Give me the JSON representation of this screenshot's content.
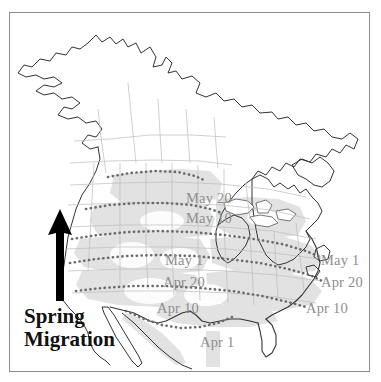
{
  "figure": {
    "type": "map",
    "background_color": "#ffffff",
    "border_color": "#8a8a8a",
    "land_outline_color": "#333333",
    "internal_border_color": "#b9b9b9",
    "shaded_region_color": "#e2e2e2",
    "isochrone_color": "#6a6a6a",
    "label_color": "#8e8e8e",
    "legend_color": "#111111"
  },
  "legend": {
    "name": "spring-migration-legend",
    "line1": "Spring",
    "line2": "Migration"
  },
  "north_arrow": {
    "name": "north-arrow",
    "direction": "up",
    "color": "#000000"
  },
  "isochrone_labels": {
    "central": [
      {
        "id": "central-may-20",
        "text": "May 20",
        "x": 176,
        "y": 178
      },
      {
        "id": "central-may-10",
        "text": "May 10",
        "x": 176,
        "y": 198
      },
      {
        "id": "central-may-1",
        "text": "May 1",
        "x": 155,
        "y": 240
      },
      {
        "id": "central-apr-20",
        "text": "Apr 20",
        "x": 153,
        "y": 262
      },
      {
        "id": "central-apr-10",
        "text": "Apr 10",
        "x": 147,
        "y": 288
      },
      {
        "id": "central-apr-1",
        "text": "Apr 1",
        "x": 190,
        "y": 322
      }
    ],
    "eastern": [
      {
        "id": "east-may-1",
        "text": "May 1",
        "x": 311,
        "y": 240
      },
      {
        "id": "east-apr-20",
        "text": "Apr 20",
        "x": 311,
        "y": 262
      },
      {
        "id": "east-apr-10",
        "text": "Apr 10",
        "x": 296,
        "y": 288
      }
    ]
  },
  "chart_data": {
    "type": "map",
    "title": "Spring Migration",
    "isochrone_dates": [
      "Apr 1",
      "Apr 10",
      "Apr 20",
      "May 1",
      "May 10",
      "May 20"
    ],
    "legend_position": "bottom-left",
    "north_indicator": true
  }
}
